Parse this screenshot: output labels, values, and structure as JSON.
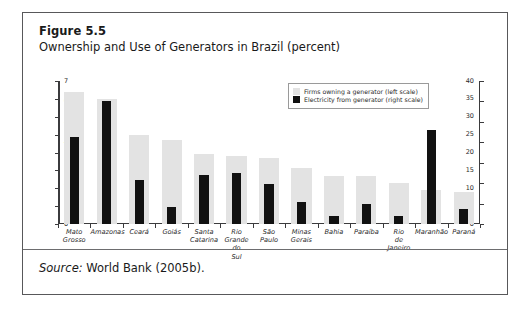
{
  "figure": {
    "number": "Figure 5.5",
    "title": "Ownership and Use of Generators in Brazil (percent)",
    "source": "Source: World Bank (2005b)."
  },
  "legend": {
    "items": [
      {
        "label": "Firms owning a generator (left scale)",
        "color": "#e3e3e3"
      },
      {
        "label": "Electricity from generator (right scale)",
        "color": "#111111"
      }
    ]
  },
  "chart_data": {
    "type": "bar",
    "title": "Ownership and Use of Generators in Brazil (percent)",
    "xlabel": "",
    "ylabel": "",
    "grid": false,
    "legend_position": "top-right",
    "categories": [
      "Mato Grosso",
      "Amazonas",
      "Ceará",
      "Goiás",
      "Santa Catarina",
      "Rio Grande do Sul",
      "São Paulo",
      "Minas Gerais",
      "Bahia",
      "Paraíba",
      "Rio de Janeiro",
      "Maranhão",
      "Paraná"
    ],
    "series": [
      {
        "name": "Firms owning a generator (left scale)",
        "axis": "left",
        "color": "#e3e3e3",
        "values": [
          37.0,
          35.0,
          25.0,
          23.5,
          19.7,
          19.0,
          18.5,
          15.8,
          13.5,
          13.5,
          11.5,
          9.5,
          9.0
        ]
      },
      {
        "name": "Electricity from generator (right scale)",
        "axis": "right",
        "color": "#111111",
        "values": [
          4.25,
          6.0,
          2.15,
          0.85,
          2.4,
          2.5,
          1.95,
          1.1,
          0.4,
          1.0,
          0.4,
          4.6,
          0.75
        ]
      }
    ],
    "left_axis": {
      "label": "",
      "ylim": [
        0,
        40
      ],
      "ticks": [
        0,
        5,
        10,
        15,
        20,
        25,
        30,
        35,
        40
      ]
    },
    "right_axis": {
      "label": "",
      "ylim": [
        0,
        7
      ],
      "ticks": [
        0,
        1,
        2,
        3,
        4,
        5,
        6,
        7
      ]
    }
  }
}
